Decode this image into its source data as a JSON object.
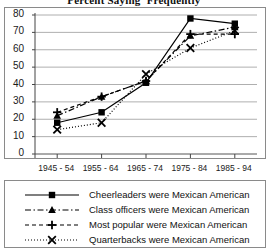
{
  "chart_data": {
    "type": "line",
    "title": "Percent Saying 'Frequently'",
    "xlabel": "",
    "ylabel": "",
    "categories": [
      "1945 - 54",
      "1955 - 64",
      "1965 - 74",
      "1975 - 84",
      "1985 - 94"
    ],
    "ylim": [
      0,
      80
    ],
    "yticks": [
      0,
      10,
      20,
      30,
      40,
      50,
      60,
      70,
      80
    ],
    "grid": true,
    "legend_position": "bottom",
    "series": [
      {
        "name": "Cheerleaders were Mexican American",
        "marker": "square",
        "line_style": "solid",
        "color": "#000000",
        "values": [
          18,
          24,
          41,
          78,
          75
        ]
      },
      {
        "name": "Class officers were Mexican American",
        "marker": "triangle",
        "line_style": "dash-dot",
        "color": "#000000",
        "values": [
          22,
          33,
          42,
          68,
          73
        ]
      },
      {
        "name": "Most popular were Mexican American",
        "marker": "plus",
        "line_style": "dashed",
        "color": "#000000",
        "values": [
          24,
          33,
          42,
          69,
          69
        ]
      },
      {
        "name": "Quarterbacks were Mexican American",
        "marker": "x",
        "line_style": "dotted",
        "color": "#000000",
        "values": [
          14,
          18,
          46,
          61,
          71
        ]
      }
    ]
  },
  "axis": {
    "y_tick_labels": [
      "80",
      "70",
      "60",
      "50",
      "40",
      "30",
      "20",
      "10",
      "0"
    ],
    "x_tick_labels": [
      "1945 - 54",
      "1955 - 64",
      "1965 - 74",
      "1975 - 84",
      "1985 - 94"
    ]
  },
  "legend": {
    "entries": [
      {
        "label": "Cheerleaders were Mexican American"
      },
      {
        "label": "Class officers were Mexican American"
      },
      {
        "label": "Most popular were Mexican American"
      },
      {
        "label": "Quarterbacks were Mexican American"
      }
    ]
  }
}
